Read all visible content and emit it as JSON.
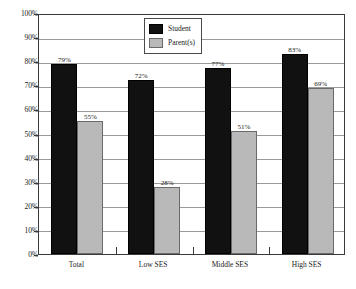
{
  "chart_data": {
    "type": "bar",
    "title": "",
    "subtitle": "",
    "xlabel": "",
    "ylabel": "",
    "ylim": [
      0,
      100
    ],
    "ytick_labels": [
      "0%",
      "10%",
      "20%",
      "30%",
      "40%",
      "50%",
      "60%",
      "70%",
      "80%",
      "90%",
      "100%"
    ],
    "ytick_values": [
      0,
      10,
      20,
      30,
      40,
      50,
      60,
      70,
      80,
      90,
      100
    ],
    "categories": [
      "Total",
      "Low SES",
      "Middle SES",
      "High SES"
    ],
    "grid": true,
    "legend_position": "top-center-left",
    "series": [
      {
        "name": "Student",
        "color": "#111111",
        "values": [
          79,
          72,
          77,
          83
        ],
        "value_labels": [
          "79%",
          "72%",
          "77%",
          "83%"
        ]
      },
      {
        "name": "Parent(s)",
        "color": "#b9b9b9",
        "values": [
          55,
          28,
          51,
          69
        ],
        "value_labels": [
          "55%",
          "28%",
          "51%",
          "69%"
        ]
      }
    ]
  },
  "legend": {
    "items": [
      {
        "label": "Student",
        "swatch": "black-swatch"
      },
      {
        "label": "Parent(s)",
        "swatch": "gray-swatch"
      }
    ]
  }
}
